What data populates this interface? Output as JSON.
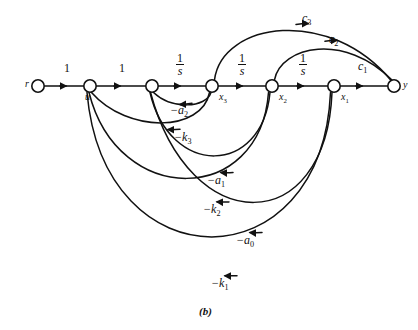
{
  "figure": {
    "caption": "(b)",
    "type": "signal-flow-graph",
    "background_color": "#ffffff",
    "stroke_color": "#111111"
  },
  "nodes": [
    {
      "id": "r",
      "label": "r",
      "x": 38,
      "y": 86,
      "label_dx": -11,
      "label_dy": -4
    },
    {
      "id": "u",
      "label": "u",
      "x": 90,
      "y": 86,
      "label_dx": -4,
      "label_dy": 9
    },
    {
      "id": "n1",
      "label": "",
      "x": 152,
      "y": 86,
      "label_dx": 0,
      "label_dy": 0
    },
    {
      "id": "x3",
      "label": "x3",
      "x": 212,
      "y": 86,
      "label_dx": 7,
      "label_dy": 9
    },
    {
      "id": "x2",
      "label": "x2",
      "x": 272,
      "y": 86,
      "label_dx": 7,
      "label_dy": 9
    },
    {
      "id": "x1",
      "label": "x1",
      "x": 334,
      "y": 86,
      "label_dx": 7,
      "label_dy": 9
    },
    {
      "id": "y",
      "label": "y",
      "x": 394,
      "y": 86,
      "label_dx": 9,
      "label_dy": -3
    }
  ],
  "node_labels": {
    "r": "r",
    "u": "u",
    "x3": "x",
    "x3_sub": "3",
    "x2": "x",
    "x2_sub": "2",
    "x1": "x",
    "x1_sub": "1",
    "y": "y"
  },
  "edges": [
    {
      "id": "r-u",
      "from": "r",
      "to": "u",
      "gain": "1",
      "gain_kind": "plain",
      "label_x": 64,
      "label_y": 65
    },
    {
      "id": "u-n1",
      "from": "u",
      "to": "n1",
      "gain": "1",
      "gain_kind": "plain",
      "label_x": 119,
      "label_y": 65
    },
    {
      "id": "n1-x3",
      "from": "n1",
      "to": "x3",
      "gain": "1/s",
      "gain_kind": "fraction",
      "label_x": 177,
      "label_y": 58
    },
    {
      "id": "x3-x2",
      "from": "x3",
      "to": "x2",
      "gain": "1/s",
      "gain_kind": "fraction",
      "label_x": 239,
      "label_y": 58
    },
    {
      "id": "x2-x1",
      "from": "x2",
      "to": "x1",
      "gain": "1/s",
      "gain_kind": "fraction",
      "label_x": 300,
      "label_y": 58
    },
    {
      "id": "x1-y",
      "from": "x1",
      "to": "y",
      "gain": "c1",
      "gain_kind": "sub",
      "label_x": 360,
      "label_y": 63
    },
    {
      "id": "x2-y",
      "from": "x2",
      "to": "y",
      "gain": "c2",
      "gain_kind": "sub",
      "label_x": 331,
      "label_y": 36
    },
    {
      "id": "x3-y",
      "from": "x3",
      "to": "y",
      "gain": "c3",
      "gain_kind": "sub",
      "label_x": 304,
      "label_y": 15
    },
    {
      "id": "x3-n1",
      "from": "x3",
      "to": "n1",
      "gain": "-a2",
      "gain_kind": "sub",
      "label_x": 172,
      "label_y": 106
    },
    {
      "id": "x3-u",
      "from": "x3",
      "to": "u",
      "gain": "-k3",
      "gain_kind": "sub",
      "label_x": 176,
      "label_y": 134
    },
    {
      "id": "x2-n1",
      "from": "x2",
      "to": "n1",
      "gain": "-a1",
      "gain_kind": "sub",
      "label_x": 209,
      "label_y": 177
    },
    {
      "id": "x2-u",
      "from": "x2",
      "to": "u",
      "gain": "-k2",
      "gain_kind": "sub",
      "label_x": 205,
      "label_y": 206
    },
    {
      "id": "x1-n1",
      "from": "x1",
      "to": "n1",
      "gain": "-a0",
      "gain_kind": "sub",
      "label_x": 238,
      "label_y": 237
    },
    {
      "id": "x1-u",
      "from": "x1",
      "to": "u",
      "gain": "-k1",
      "gain_kind": "sub",
      "label_x": 213,
      "label_y": 280
    }
  ],
  "gain_labels": {
    "one_a": "1",
    "one_b": "1",
    "frac_num": "1",
    "frac_den": "s",
    "c1_base": "c",
    "c1_sub": "1",
    "c2_base": "c",
    "c2_sub": "2",
    "c3_base": "c",
    "c3_sub": "3",
    "a2_base": "−a",
    "a2_sub": "2",
    "a1_base": "−a",
    "a1_sub": "1",
    "a0_base": "−a",
    "a0_sub": "0",
    "k3_base": "−k",
    "k3_sub": "3",
    "k2_base": "−k",
    "k2_sub": "2",
    "k1_base": "−k",
    "k1_sub": "1"
  }
}
